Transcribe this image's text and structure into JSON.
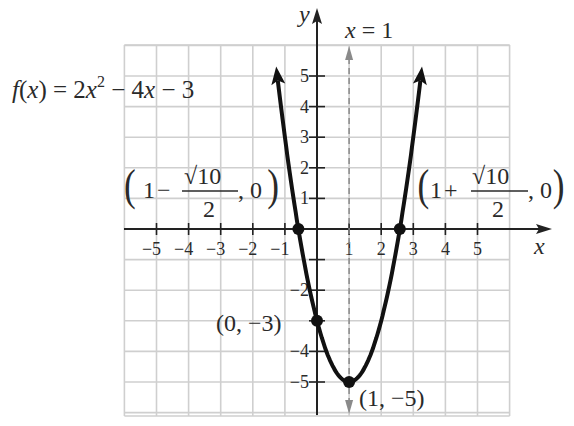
{
  "chart_data": {
    "type": "line",
    "title": "",
    "function_label": "f(x) = 2x^2 - 4x - 3",
    "function_parts": {
      "lhs": "f(x) = 2x",
      "exp": "2",
      "rhs": " − 4x − 3"
    },
    "xlabel": "x",
    "ylabel": "y",
    "xlim": [
      -6,
      6
    ],
    "ylim": [
      -6,
      6
    ],
    "grid": true,
    "x_ticks": [
      -5,
      -4,
      -3,
      -2,
      -1,
      1,
      2,
      3,
      4,
      5
    ],
    "x_tick_labels": [
      "−5",
      "−4",
      "−3",
      "−2",
      "−1",
      "1",
      "2",
      "3",
      "4",
      "5"
    ],
    "y_ticks": [
      5,
      4,
      3,
      2,
      1,
      -2,
      -4,
      -5
    ],
    "y_tick_labels": [
      "5",
      "4",
      "3",
      "2",
      "1",
      "−2",
      "−4",
      "−5"
    ],
    "axis_of_symmetry": {
      "label": "x = 1",
      "x": 1,
      "style": "dashed"
    },
    "points": [
      {
        "name": "x-intercept-left",
        "x": -0.58,
        "y": 0,
        "label": "(1 − √10/2, 0)"
      },
      {
        "name": "x-intercept-right",
        "x": 2.58,
        "y": 0,
        "label": "(1 + √10/2, 0)"
      },
      {
        "name": "y-intercept",
        "x": 0,
        "y": -3,
        "label": "(0, −3)"
      },
      {
        "name": "vertex",
        "x": 1,
        "y": -5,
        "label": "(1, −5)"
      }
    ],
    "series": [
      {
        "name": "f(x) = 2x^2 - 4x - 3",
        "x": [
          -1.3,
          -1,
          -0.5,
          0,
          0.5,
          1,
          1.5,
          2,
          2.5,
          3,
          3.3
        ],
        "values": [
          5.58,
          3,
          -0.5,
          -3,
          -4.5,
          -5,
          -4.5,
          -3,
          -0.5,
          3,
          5.58
        ]
      }
    ]
  },
  "labels": {
    "y_axis": "y",
    "x_axis": "x",
    "symmetry": "x = 1",
    "left_intercept": {
      "open": "(",
      "one": "1",
      "op": "−",
      "num": "√10",
      "den": "2",
      "tail": ", 0",
      "close": ")"
    },
    "right_intercept": {
      "open": "(",
      "one": "1",
      "op": "+",
      "num": "√10",
      "den": "2",
      "tail": ", 0",
      "close": ")"
    },
    "y_intercept": "(0, −3)",
    "vertex": "(1, −5)"
  },
  "colors": {
    "curve": "#111111",
    "grid": "#cfcfcf",
    "axis": "#222222",
    "symmetry_line": "#8a8a8a",
    "text": "#2a2a2a"
  }
}
